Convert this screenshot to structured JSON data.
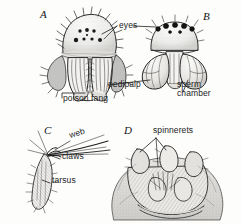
{
  "figure": {
    "kind": "scientific-illustration",
    "background_color": "#fdfdfc",
    "ink_color": "#1c1c1c"
  },
  "panels": [
    {
      "id": "A",
      "letter": "A",
      "caption": "front view of spider head with chelicerae and poison fangs",
      "labels": [
        "eyes",
        "poison fang"
      ]
    },
    {
      "id": "B",
      "letter": "B",
      "caption": "front view of male spider head with pedipalps",
      "labels": [
        "eyes",
        "pedipalp",
        "sperm chamber"
      ]
    },
    {
      "id": "C",
      "letter": "C",
      "caption": "tip of spider leg gripping web strands",
      "labels": [
        "web",
        "claws",
        "tarsus"
      ]
    },
    {
      "id": "D",
      "letter": "D",
      "caption": "underside of spider abdomen showing spinnerets",
      "labels": [
        "spinnerets"
      ]
    }
  ],
  "labels": {
    "eyes": "eyes",
    "poison_fang": "poison fang",
    "pedipalp": "pedipalp",
    "sperm_chamber_line1": "sperm",
    "sperm_chamber_line2": "chamber",
    "web": "web",
    "claws": "claws",
    "tarsus": "tarsus",
    "spinnerets": "spinnerets"
  },
  "panel_letters": {
    "a": "A",
    "b": "B",
    "c": "C",
    "d": "D"
  }
}
